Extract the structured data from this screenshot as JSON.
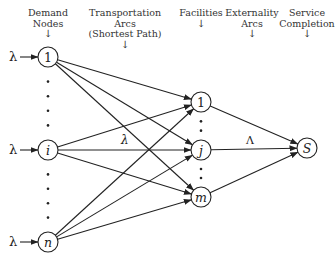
{
  "headers": [
    {
      "id": "demand",
      "lines": [
        "Demand",
        "Nodes"
      ],
      "arrow": "↓",
      "cx": 48
    },
    {
      "id": "transport",
      "lines": [
        "Transportation",
        "Arcs",
        "(Shortest Path)"
      ],
      "arrow": "↓",
      "cx": 125
    },
    {
      "id": "facilities",
      "lines": [
        "Facilities"
      ],
      "arrow": "↓",
      "cx": 201
    },
    {
      "id": "externality",
      "lines": [
        "Externality",
        "Arcs"
      ],
      "arrow": "↓",
      "cx": 252
    },
    {
      "id": "service",
      "lines": [
        "Service",
        "Completion"
      ],
      "arrow": "↓",
      "cx": 307
    }
  ],
  "nodes": {
    "demand": [
      {
        "label": "1",
        "italic": false,
        "x": 48,
        "y": 57
      },
      {
        "label": "i",
        "italic": true,
        "x": 48,
        "y": 150
      },
      {
        "label": "n",
        "italic": true,
        "x": 48,
        "y": 242
      }
    ],
    "facility": [
      {
        "label": "1",
        "italic": false,
        "x": 201,
        "y": 102
      },
      {
        "label": "j",
        "italic": true,
        "x": 201,
        "y": 150
      },
      {
        "label": "m",
        "italic": true,
        "x": 201,
        "y": 197
      }
    ],
    "sink": {
      "label": "S",
      "italic": true,
      "x": 307,
      "y": 148
    }
  },
  "input_arrival_label": "λ",
  "transport_arc_label": "λ",
  "externality_arc_label": "Λ",
  "colors": {
    "stroke": "#222222",
    "text": "#222222",
    "background": "#ffffff"
  }
}
